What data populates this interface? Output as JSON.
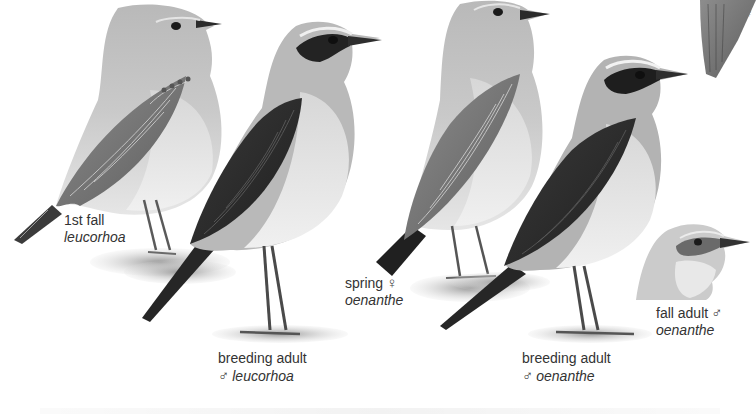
{
  "plate": {
    "subject": "Northern Wheatear plumages",
    "figures": [
      {
        "id": "fig1",
        "caption_line1": "1st fall",
        "caption_line2": "leucorhoa",
        "sex_symbol": ""
      },
      {
        "id": "fig2",
        "caption_line1": "breeding adult",
        "caption_line2": "leucorhoa",
        "sex_symbol": "♂"
      },
      {
        "id": "fig3",
        "caption_line1": "spring",
        "caption_line2": "oenanthe",
        "sex_symbol": "♀"
      },
      {
        "id": "fig4",
        "caption_line1": "breeding adult",
        "caption_line2": "oenanthe",
        "sex_symbol": "♂"
      },
      {
        "id": "fig5",
        "caption_line1": "fall adult",
        "caption_line2": "oenanthe",
        "sex_symbol": "♂"
      },
      {
        "id": "fig6-partial",
        "caption_line1": "",
        "caption_line2": "",
        "sex_symbol": "♀"
      }
    ]
  },
  "colors": {
    "background": "#ffffff",
    "text": "#333333",
    "mask_black": "#1e1e1e",
    "wing_dark": "#2f2f2f",
    "back_grey": "#a9a9a9",
    "breast_pale": "#e4e4e4"
  }
}
